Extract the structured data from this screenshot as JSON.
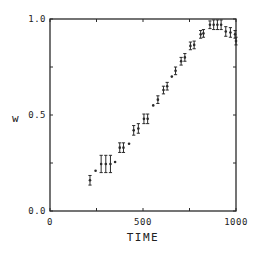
{
  "chart_data": {
    "type": "scatter",
    "title": "",
    "xlabel": "TIME",
    "ylabel": "w",
    "xlim": [
      0,
      1000
    ],
    "ylim": [
      0.0,
      1.0
    ],
    "xticks": [
      0,
      250,
      500,
      750,
      1000
    ],
    "xtick_labels": [
      "0",
      "",
      "500",
      "",
      "1000"
    ],
    "yticks": [
      0.0,
      0.25,
      0.5,
      0.75,
      1.0
    ],
    "ytick_labels": [
      "0.0",
      "",
      "0.5",
      "",
      "1.0"
    ],
    "grid": false,
    "legend": null,
    "series": [
      {
        "name": "w",
        "marker": "dot-with-errorbar",
        "x": [
          215,
          245,
          275,
          300,
          325,
          350,
          375,
          395,
          425,
          450,
          475,
          505,
          525,
          555,
          580,
          610,
          630,
          655,
          675,
          705,
          725,
          755,
          775,
          810,
          825,
          860,
          880,
          900,
          920,
          945,
          970,
          995,
          1000
        ],
        "y": [
          0.16,
          0.21,
          0.245,
          0.245,
          0.245,
          0.255,
          0.33,
          0.33,
          0.35,
          0.42,
          0.43,
          0.48,
          0.48,
          0.55,
          0.58,
          0.63,
          0.65,
          0.7,
          0.73,
          0.78,
          0.8,
          0.86,
          0.865,
          0.92,
          0.925,
          0.97,
          0.97,
          0.97,
          0.97,
          0.935,
          0.93,
          0.92,
          0.885
        ],
        "yerr": [
          0.025,
          0.0,
          0.045,
          0.045,
          0.045,
          0.0,
          0.025,
          0.025,
          0.0,
          0.025,
          0.025,
          0.025,
          0.025,
          0.0,
          0.02,
          0.02,
          0.02,
          0.0,
          0.02,
          0.02,
          0.02,
          0.02,
          0.02,
          0.02,
          0.02,
          0.02,
          0.025,
          0.025,
          0.025,
          0.025,
          0.025,
          0.02,
          0.02
        ]
      }
    ]
  },
  "axes": {
    "x_title": "TIME",
    "y_title": "w"
  }
}
